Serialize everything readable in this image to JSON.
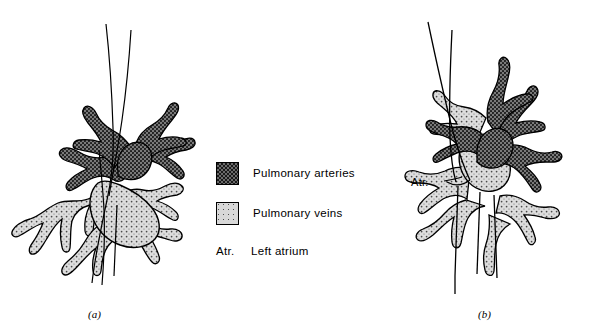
{
  "figure": {
    "title": "",
    "type": "anatomical-diagram",
    "panels": [
      {
        "id": "a",
        "label": "(a)",
        "caption": ""
      },
      {
        "id": "b",
        "label": "(b)",
        "caption": "",
        "annotation": "Atr."
      }
    ]
  },
  "legend": {
    "items": [
      {
        "swatch": "dark-stipple",
        "label": "Pulmonary arteries",
        "color": "#6b6b6b"
      },
      {
        "swatch": "light-stipple",
        "label": "Pulmonary veins",
        "color": "#d8d8d8"
      }
    ],
    "notes": [
      {
        "abbr": "Atr.",
        "text": "Left atrium"
      }
    ]
  },
  "annotations": {
    "atr_callout": "Atr."
  },
  "colors": {
    "artery_fill": "#6b6b6b",
    "vein_fill": "#d8d8d8",
    "outline": "#000000",
    "background": "#ffffff"
  }
}
